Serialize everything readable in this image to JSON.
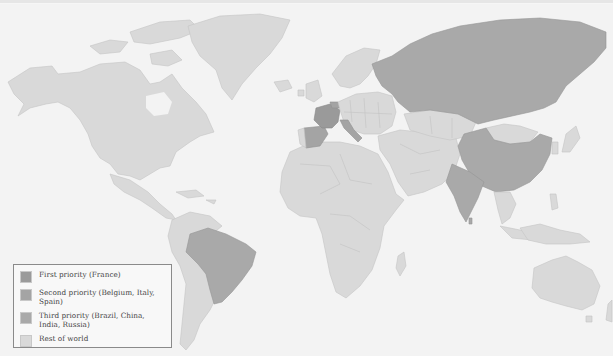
{
  "map": {
    "type": "choropleth world map",
    "background_color": "#f3f3f3",
    "regions": {
      "first_priority": [
        "France"
      ],
      "second_priority": [
        "Belgium",
        "Italy",
        "Spain"
      ],
      "third_priority": [
        "Brazil",
        "China",
        "India",
        "Russia"
      ],
      "rest_of_world": "All other countries"
    }
  },
  "legend": {
    "items": [
      {
        "key": "first",
        "label": "First priority (France)",
        "color": "#9a9a9a"
      },
      {
        "key": "second",
        "label": "Second priority (Belgium, Italy, Spain)",
        "color": "#a4a4a4"
      },
      {
        "key": "third",
        "label": "Third priority (Brazil, China, India, Russia)",
        "color": "#a9a9a9"
      },
      {
        "key": "rest",
        "label": "Rest of world",
        "color": "#d9d9d9"
      }
    ]
  }
}
